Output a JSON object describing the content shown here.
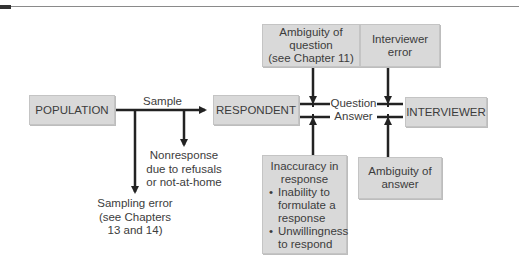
{
  "diagram": {
    "nodes": {
      "population": "POPULATION",
      "respondent": "RESPONDENT",
      "interviewer": "INTERVIEWER",
      "ambiguity_question": [
        "Ambiguity of",
        "question",
        "(see Chapter 11)"
      ],
      "interviewer_error": [
        "Interviewer",
        "error"
      ],
      "inaccuracy": {
        "title": [
          "Inaccuracy in",
          "response"
        ],
        "bullets": [
          [
            "Inability to",
            "formulate a",
            "response"
          ],
          [
            "Unwillingness",
            "to respond"
          ]
        ]
      },
      "ambiguity_answer": [
        "Ambiguity of",
        "answer"
      ]
    },
    "labels": {
      "sample": "Sample",
      "question": "Question",
      "answer": "Answer",
      "nonresponse": [
        "Nonresponse",
        "due to refusals",
        "or not-at-home"
      ],
      "sampling_error": [
        "Sampling error",
        "(see Chapters",
        "13 and 14)"
      ]
    },
    "bullet_char": "•",
    "colors": {
      "box_fill": "#d9d9d9",
      "arrow": "#222222",
      "text": "#3c3c3c"
    }
  }
}
